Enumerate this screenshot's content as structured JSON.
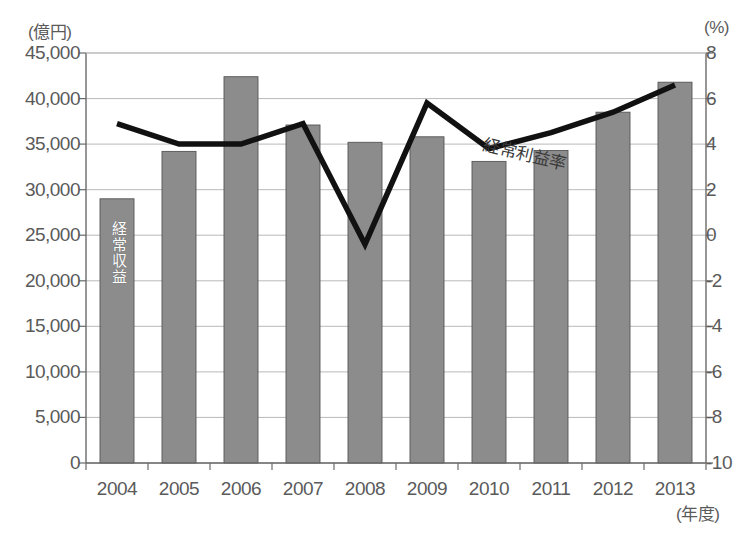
{
  "chart_data": {
    "type": "bar",
    "title": "",
    "subtitle": "",
    "xlabel": "(年度)",
    "categories": [
      "2004",
      "2005",
      "2006",
      "2007",
      "2008",
      "2009",
      "2010",
      "2011",
      "2012",
      "2013"
    ],
    "grid": true,
    "legend_position": "inline-annotation",
    "left_axis": {
      "unit_label": "(億円)",
      "ylabel": "",
      "ylim": [
        0,
        45000
      ],
      "tick_step": 5000,
      "ticks": [
        "0",
        "5,000",
        "10,000",
        "15,000",
        "20,000",
        "25,000",
        "30,000",
        "35,000",
        "40,000",
        "45,000"
      ],
      "tick_values": [
        0,
        5000,
        10000,
        15000,
        20000,
        25000,
        30000,
        35000,
        40000,
        45000
      ]
    },
    "right_axis": {
      "unit_label": "(%)",
      "ylabel": "",
      "ylim": [
        -10,
        8
      ],
      "tick_step": 2,
      "ticks": [
        "-10",
        "-8",
        "-6",
        "-4",
        "-2",
        "0",
        "2",
        "4",
        "6",
        "8"
      ],
      "tick_values": [
        -10,
        -8,
        -6,
        -4,
        -2,
        0,
        2,
        4,
        6,
        8
      ]
    },
    "series": [
      {
        "name": "経常収益",
        "type": "bar",
        "axis": "left",
        "color": "#8c8c8c",
        "edge_color": "#555555",
        "values": [
          29000,
          34200,
          42400,
          37100,
          35200,
          35800,
          33100,
          34300,
          38500,
          41800
        ]
      },
      {
        "name": "経常利益率",
        "type": "line",
        "axis": "right",
        "color": "#111111",
        "values": [
          4.9,
          4.0,
          4.0,
          4.9,
          -0.4,
          5.8,
          3.8,
          4.5,
          5.4,
          6.6
        ]
      }
    ],
    "annotations": [
      {
        "text": "経常収益",
        "placement": "inside-first-bar",
        "orientation": "vertical"
      },
      {
        "text": "経常利益率",
        "placement": "above-line-2008-2011",
        "orientation": "rotated"
      }
    ]
  }
}
